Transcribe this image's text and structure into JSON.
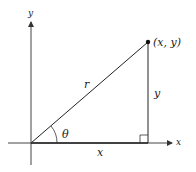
{
  "diagram": {
    "axis_x_label": "x",
    "axis_y_label": "y",
    "point_label": "(x, y)",
    "hypotenuse_label": "r",
    "angle_label": "θ",
    "adjacent_label": "x",
    "opposite_label": "y",
    "colors": {
      "line": "#222222",
      "background": "#ffffff"
    }
  }
}
